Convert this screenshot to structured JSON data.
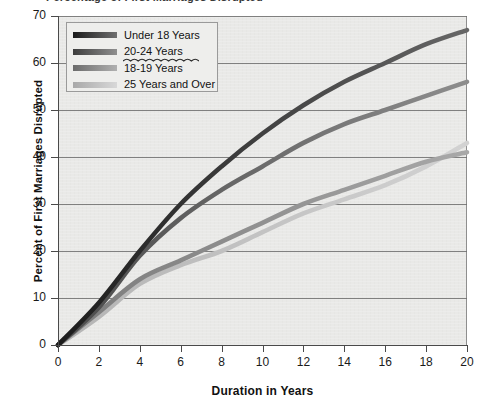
{
  "title_clipped": "Percentage of First Marriages Disrupted",
  "chart_data": {
    "type": "line",
    "xlabel": "Duration in Years",
    "ylabel": "Percent of First Marriages Disrupted",
    "xlim": [
      0,
      20
    ],
    "ylim": [
      0,
      70
    ],
    "xticks": [
      0,
      2,
      4,
      6,
      8,
      10,
      12,
      14,
      16,
      18,
      20
    ],
    "yticks": [
      0,
      10,
      20,
      30,
      40,
      50,
      60,
      70
    ],
    "grid": "horizontal",
    "legend_position": "top-left",
    "x": [
      0,
      2,
      4,
      6,
      8,
      10,
      12,
      14,
      16,
      18,
      20
    ],
    "series": [
      {
        "name": "Under 18 Years",
        "color": "#1c1c1c",
        "color_light": "#666666",
        "values": [
          0,
          9,
          20,
          30,
          38,
          45,
          51,
          56,
          60,
          64,
          67
        ]
      },
      {
        "name": "20-24 Years",
        "color": "#4a4a4a",
        "color_light": "#8d8d8d",
        "values": [
          0,
          8,
          19,
          27,
          33,
          38,
          43,
          47,
          50,
          53,
          56
        ]
      },
      {
        "name": "18-19 Years",
        "color": "#7a7a7a",
        "color_light": "#a8a8a8",
        "values": [
          0,
          7,
          14,
          18,
          22,
          26,
          30,
          33,
          36,
          39,
          41
        ]
      },
      {
        "name": "25 Years and Over",
        "color": "#b4b4b4",
        "color_light": "#d2d2d2",
        "values": [
          0,
          6,
          13,
          17,
          20,
          24,
          28,
          31,
          34,
          38,
          43
        ]
      }
    ],
    "legend": [
      {
        "label": "Under 18 Years",
        "swatch_from": "#1a1a1a",
        "swatch_to": "#6f6f6f"
      },
      {
        "label": "20-24 Years",
        "swatch_from": "#3d3d3d",
        "swatch_to": "#8f8f8f",
        "underline": "squiggle"
      },
      {
        "label": "18-19 Years",
        "swatch_from": "#6b6b6b",
        "swatch_to": "#b0b0b0"
      },
      {
        "label": "25 Years and Over",
        "swatch_from": "#a9a9a9",
        "swatch_to": "#d8d8d8"
      }
    ],
    "colors": {
      "plot_background": "#e9e9e7",
      "gridline": "#6e6e6e",
      "axis": "#4a4a4a",
      "legend_background": "#eeeeec",
      "legend_border": "#9a9a9a"
    }
  }
}
